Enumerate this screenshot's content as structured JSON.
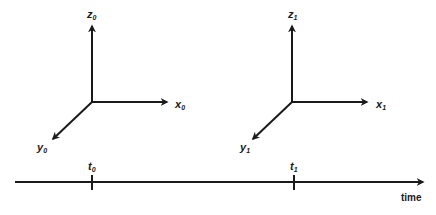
{
  "frames": [
    {
      "name": "frame-0",
      "x_label": "x",
      "y_label": "y",
      "z_label": "z",
      "subscript": "0"
    },
    {
      "name": "frame-1",
      "x_label": "x",
      "y_label": "y",
      "z_label": "z",
      "subscript": "1"
    }
  ],
  "timeline": {
    "axis_label": "time",
    "ticks": [
      {
        "label": "t",
        "subscript": "0"
      },
      {
        "label": "t",
        "subscript": "1"
      }
    ]
  },
  "colors": {
    "stroke": "#1a1a1a",
    "background": "#ffffff"
  }
}
